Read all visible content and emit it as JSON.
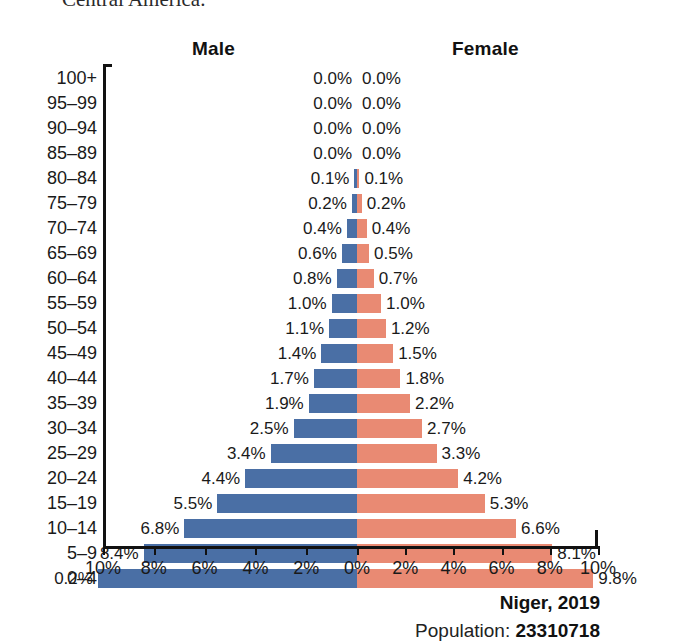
{
  "page_fragment": "Central America.",
  "chart_data": {
    "type": "bar",
    "subtype": "population-pyramid",
    "title": "Niger, 2019",
    "xlabel": "",
    "ylabel": "",
    "xlim": [
      -10,
      10
    ],
    "grid": false,
    "legend_position": "top",
    "axis_tick_labels": [
      "10%",
      "8%",
      "6%",
      "4%",
      "2%",
      "0%",
      "2%",
      "4%",
      "6%",
      "8%",
      "10%"
    ],
    "axis_tick_values": [
      -10,
      -8,
      -6,
      -4,
      -2,
      0,
      2,
      4,
      6,
      8,
      10
    ],
    "categories": [
      "100+",
      "95–99",
      "90–94",
      "85–89",
      "80–84",
      "75–79",
      "70–74",
      "65–69",
      "60–64",
      "55–59",
      "50–54",
      "45–49",
      "40–44",
      "35–39",
      "30–34",
      "25–29",
      "20–24",
      "15–19",
      "10–14",
      "5–9",
      "0–4"
    ],
    "series": [
      {
        "name": "Male",
        "color": "#4a6fa5",
        "values": [
          0.0,
          0.0,
          0.0,
          0.0,
          0.1,
          0.2,
          0.4,
          0.6,
          0.8,
          1.0,
          1.1,
          1.4,
          1.7,
          1.9,
          2.5,
          3.4,
          4.4,
          5.5,
          6.8,
          8.4,
          10.2
        ],
        "labels": [
          "0.0%",
          "0.0%",
          "0.0%",
          "0.0%",
          "0.1%",
          "0.2%",
          "0.4%",
          "0.6%",
          "0.8%",
          "1.0%",
          "1.1%",
          "1.4%",
          "1.7%",
          "1.9%",
          "2.5%",
          "3.4%",
          "4.4%",
          "5.5%",
          "6.8%",
          "8.4%",
          "0.2%"
        ]
      },
      {
        "name": "Female",
        "color": "#e98a73",
        "values": [
          0.0,
          0.0,
          0.0,
          0.0,
          0.1,
          0.2,
          0.4,
          0.5,
          0.7,
          1.0,
          1.2,
          1.5,
          1.8,
          2.2,
          2.7,
          3.3,
          4.2,
          5.3,
          6.6,
          8.1,
          9.8
        ],
        "labels": [
          "0.0%",
          "0.0%",
          "0.0%",
          "0.0%",
          "0.1%",
          "0.2%",
          "0.4%",
          "0.5%",
          "0.7%",
          "1.0%",
          "1.2%",
          "1.5%",
          "1.8%",
          "2.2%",
          "2.7%",
          "3.3%",
          "4.2%",
          "5.3%",
          "6.6%",
          "8.1%",
          "9.8%"
        ]
      }
    ]
  },
  "headers": {
    "male": "Male",
    "female": "Female"
  },
  "footer": {
    "country_year": "Niger, 2019",
    "population_prefix": "Population: ",
    "population_value": "23310718"
  },
  "colors": {
    "male_bar": "#4a6fa5",
    "female_bar": "#e98a73",
    "axis": "#111111",
    "text": "#1a1a1a"
  }
}
